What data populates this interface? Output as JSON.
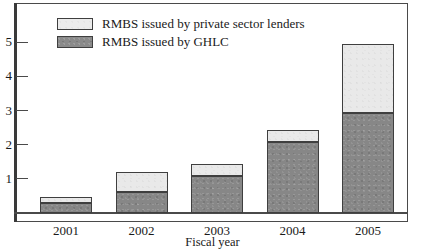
{
  "chart_data": {
    "type": "bar",
    "subtype": "stacked-vertical",
    "title": "",
    "xlabel": "Fiscal year",
    "ylabel": "",
    "categories": [
      "2001",
      "2002",
      "2003",
      "2004",
      "2005"
    ],
    "series": [
      {
        "name": "RMBS issued by GHLC",
        "color": "#878787",
        "values": [
          0.28,
          0.6,
          1.07,
          2.08,
          2.92
        ]
      },
      {
        "name": "RMBS issued by private sector lenders",
        "color": "#e9e9e9",
        "values": [
          0.19,
          0.6,
          0.35,
          0.34,
          2.03
        ]
      }
    ],
    "totals": [
      0.47,
      1.2,
      1.42,
      2.42,
      4.95
    ],
    "ylim": [
      0,
      5.8
    ],
    "yticks": [
      1,
      2,
      3,
      4,
      5
    ],
    "ytick_labels": [
      "1",
      "2",
      "3",
      "4",
      "5"
    ],
    "grid": false,
    "legend_position": "top-left",
    "stack_order": [
      "RMBS issued by GHLC",
      "RMBS issued by private sector lenders"
    ]
  },
  "legend": {
    "entries": [
      {
        "label": "RMBS issued by private sector lenders",
        "swatch": "light"
      },
      {
        "label": "RMBS issued by GHLC",
        "swatch": "dark"
      }
    ]
  },
  "axes": {
    "x_title": "Fiscal year"
  }
}
